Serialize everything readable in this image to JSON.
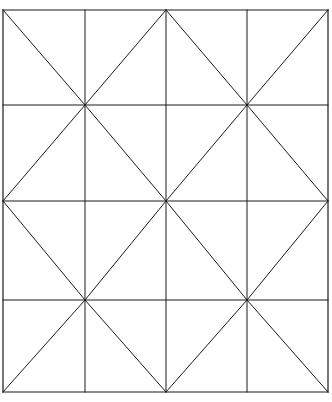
{
  "figure": {
    "type": "line-drawing",
    "canvas": {
      "width": 332,
      "height": 402,
      "background_color": "#ffffff"
    },
    "style": {
      "line_color": "#1a1a1a",
      "grid_stroke_width": 1,
      "diagonal_stroke_width": 1,
      "frame_stroke_width": 1.2
    },
    "grid": {
      "columns": 4,
      "rows": 4,
      "x_positions": [
        3,
        85,
        166,
        247,
        328
      ],
      "y_positions": [
        10,
        105,
        201,
        300,
        392
      ],
      "cell_width_avg": 81.25,
      "cell_height_avg": 95.5
    },
    "diagonals": {
      "pattern": "checkerboard",
      "rule": "backslash when (col + row) is even, slash when odd",
      "cells": [
        {
          "col": 0,
          "row": 0,
          "direction": "backslash"
        },
        {
          "col": 1,
          "row": 0,
          "direction": "slash"
        },
        {
          "col": 2,
          "row": 0,
          "direction": "backslash"
        },
        {
          "col": 3,
          "row": 0,
          "direction": "slash"
        },
        {
          "col": 0,
          "row": 1,
          "direction": "slash"
        },
        {
          "col": 1,
          "row": 1,
          "direction": "backslash"
        },
        {
          "col": 2,
          "row": 1,
          "direction": "slash"
        },
        {
          "col": 3,
          "row": 1,
          "direction": "backslash"
        },
        {
          "col": 0,
          "row": 2,
          "direction": "backslash"
        },
        {
          "col": 1,
          "row": 2,
          "direction": "slash"
        },
        {
          "col": 2,
          "row": 2,
          "direction": "backslash"
        },
        {
          "col": 3,
          "row": 2,
          "direction": "slash"
        },
        {
          "col": 0,
          "row": 3,
          "direction": "slash"
        },
        {
          "col": 1,
          "row": 3,
          "direction": "backslash"
        },
        {
          "col": 2,
          "row": 3,
          "direction": "slash"
        },
        {
          "col": 3,
          "row": 3,
          "direction": "backslash"
        }
      ]
    },
    "nodes": {
      "description": "Interior vertices where diagonals meet form eight-way asterisk crossings",
      "asterisk_points": [
        {
          "x": 85,
          "y": 105
        },
        {
          "x": 247,
          "y": 105
        },
        {
          "x": 166,
          "y": 201
        },
        {
          "x": 85,
          "y": 300
        },
        {
          "x": 247,
          "y": 300
        }
      ]
    }
  }
}
